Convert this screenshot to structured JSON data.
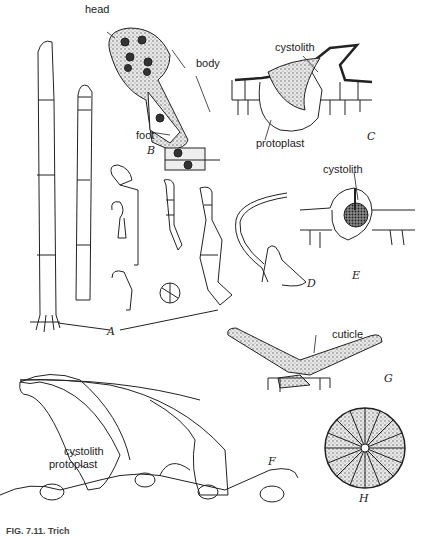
{
  "figure": {
    "panels": {
      "A": "A",
      "B": "B",
      "C": "C",
      "D": "D",
      "E": "E",
      "F": "F",
      "G": "G",
      "H": "H"
    },
    "labels": {
      "head": "head",
      "body": "body",
      "foot": "foot",
      "cystolith_c": "cystolith",
      "protoplast_c": "protoplast",
      "cystolith_e": "cystolith",
      "cuticle": "cuticle",
      "cystolith_f": "cystolith",
      "protoplast_f": "protoplast"
    },
    "caption": "FIG. 7.11. Trich"
  }
}
